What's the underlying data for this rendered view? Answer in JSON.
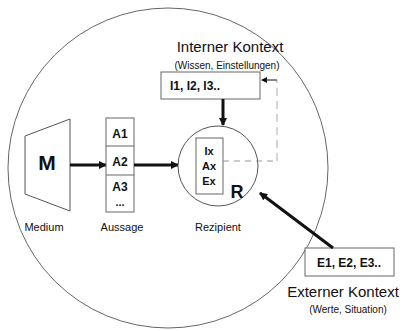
{
  "diagram": {
    "medium": {
      "symbol": "M",
      "label": "Medium"
    },
    "aussage": {
      "items": [
        "A1",
        "A2",
        "A3",
        "..."
      ],
      "label": "Aussage"
    },
    "rezipient": {
      "symbol": "R",
      "items": [
        "Ix",
        "Ax",
        "Ex"
      ],
      "label": "Rezipient"
    },
    "interner_kontext": {
      "title": "Interner Kontext",
      "subtitle": "(Wissen, Einstellungen)",
      "values": "I1, I2, I3.."
    },
    "externer_kontext": {
      "title": "Externer Kontext",
      "subtitle": "(Werte, Situation)",
      "values": "E1, E2, E3.."
    }
  },
  "colors": {
    "stroke": "#111111",
    "thin_stroke": "#555555",
    "dashed": "#999999",
    "background": "#ffffff"
  }
}
